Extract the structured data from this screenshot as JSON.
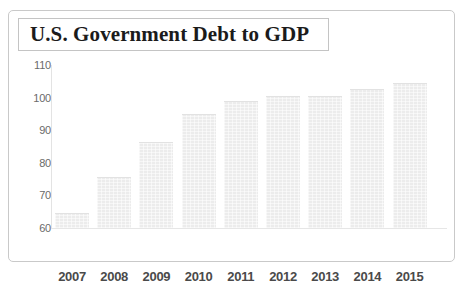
{
  "figure": {
    "title": "U.S. Government Debt to GDP"
  },
  "colors": {
    "bar_fill": "#ececec",
    "bar_edge": "#e2e2e2",
    "axis_line": "#e3e3e3",
    "tick_text": "#6a6a6a",
    "category_text": "#4a4a4a",
    "title_text": "#1b1b1b",
    "frame_border": "#c9c9c9",
    "title_box_border": "#c4c4c4",
    "background": "#ffffff"
  },
  "chart_data": {
    "type": "bar",
    "title": "U.S. Government Debt to GDP",
    "subtitle": "",
    "xlabel": "",
    "ylabel": "",
    "categories": [
      "2007",
      "2008",
      "2009",
      "2010",
      "2011",
      "2012",
      "2013",
      "2014",
      "2015"
    ],
    "values": [
      64.5,
      75.5,
      86.5,
      95.0,
      99.0,
      100.5,
      100.5,
      102.5,
      104.5
    ],
    "ylim": [
      60,
      110
    ],
    "yticks": [
      110,
      100,
      90,
      80,
      70,
      60
    ],
    "ytick_labels": [
      "110",
      "100",
      "90",
      "80",
      "70",
      "60"
    ],
    "grid": false,
    "legend": null,
    "legend_position": "none",
    "annotations": []
  }
}
